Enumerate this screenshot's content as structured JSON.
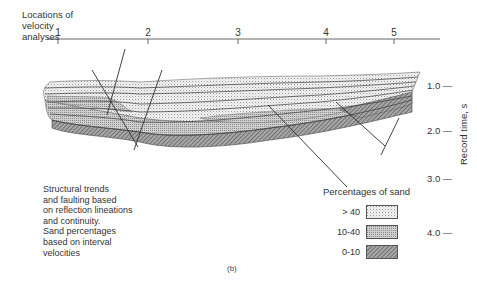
{
  "figure": {
    "caption": "(b)",
    "top_axis": {
      "title_lines": [
        "Locations of",
        "velocity",
        "analyses"
      ],
      "locations": [
        {
          "label": "1",
          "x": 58
        },
        {
          "label": "2",
          "x": 148
        },
        {
          "label": "3",
          "x": 238
        },
        {
          "label": "4",
          "x": 326
        },
        {
          "label": "5",
          "x": 394
        }
      ]
    },
    "right_axis": {
      "title": "Record time, s",
      "ticks": [
        {
          "label": "1.0 —",
          "y": 86
        },
        {
          "label": "2.0 —",
          "y": 131
        },
        {
          "label": "3.0 —",
          "y": 179
        },
        {
          "label": "4.0 —",
          "y": 233
        }
      ]
    },
    "note_lines": [
      "Structural trends",
      "and faulting based",
      "on reflection lineations",
      "and continuity.",
      "Sand percentages",
      "based on interval",
      "velocities"
    ],
    "legend": {
      "title": "Percentages of sand",
      "items": [
        {
          "label": "> 40",
          "pattern": "sparse-dots",
          "color": "#e8e8e8"
        },
        {
          "label": "10-40",
          "pattern": "dense-dots",
          "color": "#bdbdbd"
        },
        {
          "label": "0-10",
          "pattern": "hatch",
          "color": "#777777"
        }
      ]
    }
  }
}
